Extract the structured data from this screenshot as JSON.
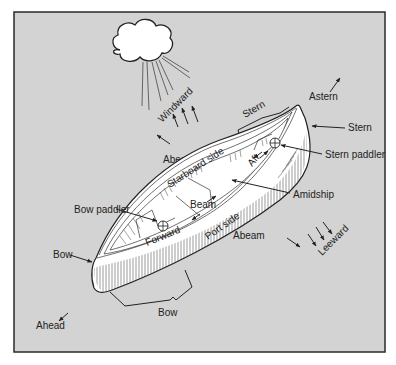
{
  "figure": {
    "type": "canoe-terminology-diagram",
    "colors": {
      "background": "#d3d3d3",
      "frame": "#2a2a2a",
      "canoe_fill": "#ffffff",
      "ink": "#222222"
    }
  },
  "labels": {
    "windward": "Windward",
    "abeam_top": "Abeam",
    "starboard_side": "Starboard side",
    "stern_bracket": "Stern",
    "astern": "Astern",
    "stern_tip": "Stern",
    "stern_paddler": "Stern paddler",
    "aft": "Aft",
    "beam": "Beam",
    "amidship": "Amidship",
    "bow_paddler": "Bow paddler",
    "forward": "Forward",
    "port_side": "Port side",
    "abeam_bottom": "Abeam",
    "leeward": "Leeward",
    "bow_tip": "Bow",
    "bow_bracket": "Bow",
    "ahead": "Ahead"
  },
  "icons": {
    "cloud": "cloud-icon",
    "wind_arrows": "wind-arrow-icon",
    "paddler_marker": "crosshair-circle-icon"
  }
}
